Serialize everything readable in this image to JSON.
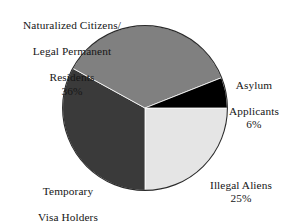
{
  "chart_data": {
    "type": "pie",
    "title": "",
    "subtitle": "",
    "xlabel": "",
    "ylabel": "",
    "legend_position": "none",
    "grid": false,
    "start_angle_deg": 90,
    "direction": "clockwise",
    "categories": [
      "Illegal Aliens",
      "Temporary Visa Holders",
      "Naturalized Citizens/Legal Permanent Residents",
      "Asylum Applicants"
    ],
    "values": [
      25,
      33,
      36,
      6
    ],
    "value_labels": [
      "25%",
      "33%",
      "36%",
      "6%"
    ],
    "colors": [
      "#e5e5e5",
      "#3a3a3a",
      "#808080",
      "#000000"
    ],
    "slices": [
      {
        "name": "illegal-aliens",
        "label": "Illegal Aliens",
        "percent": 25,
        "percent_label": "25%",
        "color": "#e5e5e5",
        "start_deg": 90,
        "end_deg": 180
      },
      {
        "name": "temporary-visa-holders",
        "label": "Temporary Visa Holders",
        "label_line1": "Temporary",
        "label_line2": "Visa Holders",
        "percent": 33,
        "percent_label": "33%",
        "color": "#3a3a3a",
        "start_deg": 180,
        "end_deg": 298.8
      },
      {
        "name": "naturalized-citizens",
        "label": "Naturalized Citizens/Legal Permanent Residents",
        "label_line1": "Naturalized Citizens/",
        "label_line2": "Legal Permanent",
        "label_line3": "Residents",
        "percent": 36,
        "percent_label": "36%",
        "color": "#808080",
        "start_deg": 298.8,
        "end_deg": 428.4
      },
      {
        "name": "asylum-applicants",
        "label": "Asylum Applicants",
        "label_line1": "Asylum",
        "label_line2": "Applicants",
        "percent": 6,
        "percent_label": "6%",
        "color": "#000000",
        "start_deg": 428.4,
        "end_deg": 450
      }
    ]
  },
  "labels": {
    "naturalized": {
      "line1": "Naturalized Citizens/",
      "line2": "Legal Permanent",
      "line3": "Residents",
      "percent": "36%"
    },
    "asylum": {
      "line1": "Asylum",
      "line2": "Applicants",
      "percent": "6%"
    },
    "illegal": {
      "line1": "Illegal Aliens",
      "percent": "25%"
    },
    "temporary": {
      "line1": "Temporary",
      "line2": "Visa Holders",
      "percent": "33%"
    }
  },
  "style": {
    "background": "#ffffff",
    "text_color": "#161616",
    "outline_color": "#2b2b2b"
  }
}
